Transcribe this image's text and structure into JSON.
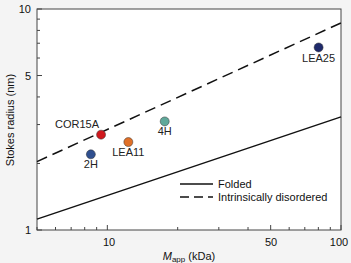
{
  "chart_data": {
    "type": "scatter",
    "title": "",
    "xlabel": "M_app (kDa)",
    "xlabel_main": "M",
    "xlabel_sub": "app",
    "xlabel_unit": " (kDa)",
    "ylabel": "Stokes radius (nm)",
    "xscale": "log",
    "yscale": "log",
    "xlim": [
      5,
      100
    ],
    "ylim": [
      1,
      10
    ],
    "x_tick_labels": [
      "10",
      "50",
      "100"
    ],
    "y_tick_labels": [
      "1",
      "5",
      "10"
    ],
    "grid": false,
    "points": [
      {
        "label": "COR15A",
        "x": 9.4,
        "y": 2.7,
        "color": "#d0191e"
      },
      {
        "label": "LEA11",
        "x": 12.3,
        "y": 2.5,
        "color": "#e07028"
      },
      {
        "label": "4H",
        "x": 17.6,
        "y": 3.1,
        "color": "#5fa89a"
      },
      {
        "label": "2H",
        "x": 8.5,
        "y": 2.2,
        "color": "#2f4f8f"
      },
      {
        "label": "LEA25",
        "x": 80.2,
        "y": 6.7,
        "color": "#1f2a6b"
      }
    ],
    "series": [
      {
        "name": "Folded",
        "style": "solid",
        "x": [
          5,
          100
        ],
        "y": [
          1.12,
          3.25
        ]
      },
      {
        "name": "Intrinsically disordered",
        "style": "dashed",
        "x": [
          5,
          100
        ],
        "y": [
          2.04,
          8.65
        ]
      }
    ],
    "legend": {
      "position": "lower right",
      "entries": [
        "Folded",
        "Intrinsically disordered"
      ]
    }
  }
}
